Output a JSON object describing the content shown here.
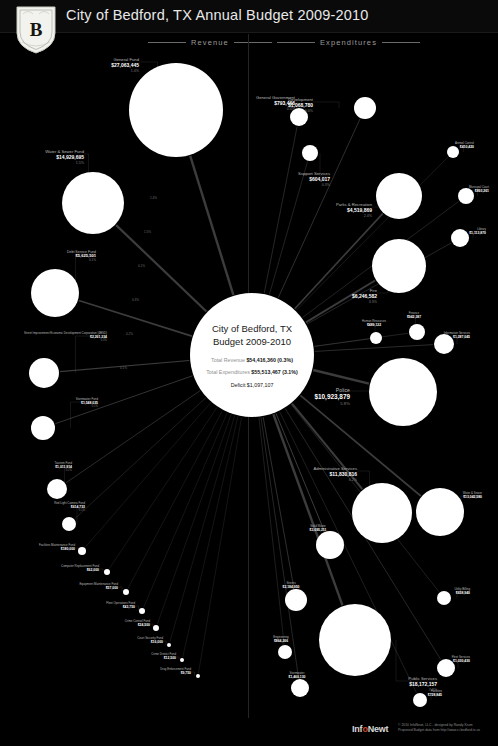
{
  "header": {
    "title": "City of Bedford, TX Annual Budget 2009-2010",
    "crest_icon": "city-crest-icon"
  },
  "sections": {
    "revenue_label": "Revenue",
    "expenditures_label": "Expenditures"
  },
  "hub": {
    "title_line1": "City of Bedford, TX",
    "title_line2": "Budget 2009-2010",
    "revenue_label": "Total Revenue",
    "revenue_value": "$54,416,360 (0.3%)",
    "expenditures_label": "Total Expenditures",
    "expenditures_value": "$55,513,467 (3.1%)",
    "deficit": "Deficit $1,097,107"
  },
  "footer": {
    "logo_pre": "Inf",
    "logo_accent": "o",
    "logo_post": "Newt",
    "credit_line1": "© 2010 InfoNewt, LLC - designed by Randy Krum",
    "credit_line2": "Proposed Budget data from http://www.ci.bedford.tx.us"
  },
  "chart_data": {
    "type": "diagram",
    "title": "City of Bedford, TX Annual Budget 2009-2010",
    "subtype": "radial-flow-bubble",
    "total_revenue": 54416360,
    "total_expenditures": 55513467,
    "deficit": 1097107,
    "revenue": [
      {
        "name": "General Fund",
        "value": "$27,063,445",
        "pct": "1.4%",
        "cx": 176,
        "cy": 110,
        "r": 47,
        "lx": 139,
        "ly": 58,
        "align": "al-r",
        "tier": "t-md"
      },
      {
        "name": "Water & Sewer Fund",
        "value": "$14,929,695",
        "pct": "1.5%",
        "cx": 93,
        "cy": 203,
        "r": 31,
        "lx": 84,
        "ly": 150,
        "align": "al-r",
        "tier": "t-md"
      },
      {
        "name": "Debt Service Fund",
        "value": "$5,625,501",
        "pct": "0.1%",
        "cx": 55,
        "cy": 293,
        "r": 24,
        "lx": 96,
        "ly": 250,
        "align": "al-r",
        "tier": "t-sm"
      },
      {
        "name": "Street Improvement Economic Development Corporation (4BSD)",
        "value": "$2,261,334",
        "pct": "0.3%",
        "cx": 44,
        "cy": 373,
        "r": 15,
        "lx": 107,
        "ly": 332,
        "align": "al-r",
        "tier": "t-xs"
      },
      {
        "name": "Stormwater Fund",
        "value": "$1,548,035",
        "pct": "0.1%",
        "cx": 43,
        "cy": 428,
        "r": 12,
        "lx": 98,
        "ly": 398,
        "align": "al-r",
        "tier": "t-xs"
      },
      {
        "name": "Tourism Fund",
        "value": "$1,011,914",
        "pct": "0.2%",
        "cx": 57,
        "cy": 489,
        "r": 10,
        "lx": 72,
        "ly": 462,
        "align": "al-r",
        "tier": "t-xs"
      },
      {
        "name": "Red Light Camera Fund",
        "value": "$614,733",
        "pct": "0.1%",
        "cx": 69,
        "cy": 524,
        "r": 7,
        "lx": 85,
        "ly": 502,
        "align": "al-r",
        "tier": "t-xs"
      },
      {
        "name": "Facilities Maintenance Fund",
        "value": "$180,000",
        "pct": "",
        "cx": 82,
        "cy": 551,
        "r": 4,
        "lx": 75,
        "ly": 544,
        "align": "al-r",
        "tier": "t-xs"
      },
      {
        "name": "Computer Replacement Fund",
        "value": "$62,000",
        "pct": "",
        "cx": 107,
        "cy": 572,
        "r": 3,
        "lx": 99,
        "ly": 565,
        "align": "al-r",
        "tier": "t-xs"
      },
      {
        "name": "Equipment Maintenance Fund",
        "value": "$57,000",
        "pct": "",
        "cx": 126,
        "cy": 592,
        "r": 3,
        "lx": 118,
        "ly": 583,
        "align": "al-r",
        "tier": "t-xs"
      },
      {
        "name": "Fleet Operations Fund",
        "value": "$43,750",
        "pct": "",
        "cx": 142,
        "cy": 611,
        "r": 3,
        "lx": 135,
        "ly": 602,
        "align": "al-r",
        "tier": "t-xs"
      },
      {
        "name": "Crime Control Fund",
        "value": "$24,500",
        "pct": "",
        "cx": 156,
        "cy": 628,
        "r": 3,
        "lx": 150,
        "ly": 620,
        "align": "al-r",
        "tier": "t-xs"
      },
      {
        "name": "Court Security Fund",
        "value": "$16,000",
        "pct": "",
        "cx": 169,
        "cy": 645,
        "r": 2,
        "lx": 163,
        "ly": 637,
        "align": "al-r",
        "tier": "t-xs"
      },
      {
        "name": "Crime District Fund",
        "value": "$12,500",
        "pct": "",
        "cx": 182,
        "cy": 660,
        "r": 2,
        "lx": 176,
        "ly": 653,
        "align": "al-r",
        "tier": "t-xs"
      },
      {
        "name": "Drug Enforcement Fund",
        "value": "$9,750",
        "pct": "",
        "cx": 198,
        "cy": 676,
        "r": 2,
        "lx": 191,
        "ly": 668,
        "align": "al-r",
        "tier": "t-xs"
      }
    ],
    "expenditures": [
      {
        "name": "Development",
        "value": "$1,068,780",
        "pct": "0.6%",
        "cx": 365,
        "cy": 108,
        "r": 11,
        "lx": 313,
        "ly": 98,
        "align": "al-r",
        "tier": "t-md"
      },
      {
        "name": "General Government",
        "value": "$793,466",
        "pct": "0.4%",
        "cx": 299,
        "cy": 117,
        "r": 9,
        "lx": 295,
        "ly": 96,
        "align": "al-r",
        "tier": "t-md"
      },
      {
        "name": "Support Services",
        "value": "$604,017",
        "pct": "0.3%",
        "cx": 310,
        "cy": 153,
        "r": 8,
        "lx": 330,
        "ly": 172,
        "align": "al-r",
        "tier": "t-md"
      },
      {
        "name": "Parks & Recreation",
        "value": "$4,519,869",
        "pct": "2.4%",
        "cx": 399,
        "cy": 196,
        "r": 23,
        "lx": 372,
        "ly": 203,
        "align": "al-r",
        "tier": "t-md"
      },
      {
        "name": "Fire",
        "value": "$6,246,582",
        "pct": "3.3%",
        "cx": 399,
        "cy": 266,
        "r": 27,
        "lx": 377,
        "ly": 289,
        "align": "al-r",
        "tier": "t-md"
      },
      {
        "name": "Police",
        "value": "$10,923,879",
        "pct": "5.8%",
        "cx": 403,
        "cy": 392,
        "r": 34,
        "lx": 350,
        "ly": 387,
        "align": "al-r",
        "tier": "t-lg"
      },
      {
        "name": "Administrative Services",
        "value": "$11,830,816",
        "pct": "6.2%",
        "cx": 382,
        "cy": 513,
        "r": 30,
        "lx": 357,
        "ly": 467,
        "align": "al-r",
        "tier": "t-md"
      },
      {
        "name": "Public Services",
        "value": "$18,172,157",
        "pct": "7.8%",
        "cx": 355,
        "cy": 640,
        "r": 36,
        "lx": 437,
        "ly": 677,
        "align": "al-r",
        "tier": "t-md"
      },
      {
        "name": "Animal Control",
        "value": "$410,420",
        "pct": "",
        "cx": 453,
        "cy": 152,
        "r": 6,
        "lx": 474,
        "ly": 142,
        "align": "al-r",
        "tier": "t-xs"
      },
      {
        "name": "Municipal Court",
        "value": "$893,261",
        "pct": "",
        "cx": 466,
        "cy": 196,
        "r": 8,
        "lx": 489,
        "ly": 186,
        "align": "al-r",
        "tier": "t-xs"
      },
      {
        "name": "Library",
        "value": "$1,113,870",
        "pct": "",
        "cx": 460,
        "cy": 238,
        "r": 9,
        "lx": 486,
        "ly": 228,
        "align": "al-r",
        "tier": "t-xs"
      },
      {
        "name": "Information Services",
        "value": "$1,287,045",
        "pct": "",
        "cx": 444,
        "cy": 344,
        "r": 10,
        "lx": 470,
        "ly": 332,
        "align": "al-r",
        "tier": "t-xs"
      },
      {
        "name": "Finance",
        "value": "$942,387",
        "pct": "",
        "cx": 417,
        "cy": 332,
        "r": 8,
        "lx": 414,
        "ly": 312,
        "align": "al-c",
        "tier": "t-xs"
      },
      {
        "name": "Human Resources",
        "value": "$489,122",
        "pct": "",
        "cx": 376,
        "cy": 338,
        "r": 6,
        "lx": 374,
        "ly": 320,
        "align": "al-c",
        "tier": "t-xs"
      },
      {
        "name": "Utility Billing",
        "value": "$658,940",
        "pct": "",
        "cx": 444,
        "cy": 598,
        "r": 7,
        "lx": 470,
        "ly": 588,
        "align": "al-r",
        "tier": "t-xs"
      },
      {
        "name": "Water & Sewer",
        "value": "$13,042,580",
        "pct": "",
        "cx": 440,
        "cy": 512,
        "r": 24,
        "lx": 482,
        "ly": 492,
        "align": "al-r",
        "tier": "t-xs"
      },
      {
        "name": "Solid Waste",
        "value": "$3,095,211",
        "pct": "",
        "cx": 330,
        "cy": 545,
        "r": 14,
        "lx": 318,
        "ly": 525,
        "align": "al-c",
        "tier": "t-xs"
      },
      {
        "name": "Streets",
        "value": "$2,184,950",
        "pct": "",
        "cx": 296,
        "cy": 600,
        "r": 11,
        "lx": 291,
        "ly": 582,
        "align": "al-c",
        "tier": "t-xs"
      },
      {
        "name": "Engineering",
        "value": "$864,266",
        "pct": "",
        "cx": 285,
        "cy": 652,
        "r": 7,
        "lx": 281,
        "ly": 636,
        "align": "al-c",
        "tier": "t-xs"
      },
      {
        "name": "Stormwater",
        "value": "$1,460,130",
        "pct": "",
        "cx": 300,
        "cy": 688,
        "r": 9,
        "lx": 297,
        "ly": 672,
        "align": "al-c",
        "tier": "t-xs"
      },
      {
        "name": "Fleet Services",
        "value": "$1,030,430",
        "pct": "",
        "cx": 446,
        "cy": 668,
        "r": 9,
        "lx": 470,
        "ly": 656,
        "align": "al-r",
        "tier": "t-xs"
      },
      {
        "name": "Facilities",
        "value": "$728,845",
        "pct": "",
        "cx": 420,
        "cy": 700,
        "r": 7,
        "lx": 442,
        "ly": 690,
        "align": "al-r",
        "tier": "t-xs"
      }
    ],
    "flow_pcts": [
      "1.4%",
      "1.5%",
      "0.1%",
      "0.3%",
      "0.2%",
      "0.1%",
      "0.6%",
      "3.3%",
      "5.8%",
      "6.2%",
      "7.8%"
    ]
  }
}
